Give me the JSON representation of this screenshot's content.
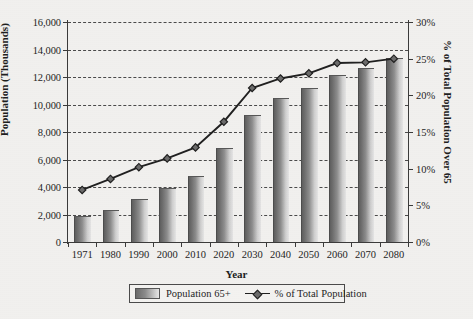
{
  "chart_data": {
    "type": "bar",
    "title": "",
    "xlabel": "Year",
    "ylabel": "Population (Thousands)",
    "y2label": "% of Total Population Over 65",
    "categories": [
      "1971",
      "1980",
      "1990",
      "2000",
      "2010",
      "2020",
      "2030",
      "2040",
      "2050",
      "2060",
      "2070",
      "2080"
    ],
    "ylim": [
      0,
      16000
    ],
    "y2lim": [
      0,
      30
    ],
    "yticks": [
      "0",
      "2,000",
      "4,000",
      "6,000",
      "8,000",
      "10,000",
      "12,000",
      "14,000",
      "16,000"
    ],
    "ytick_values": [
      0,
      2000,
      4000,
      6000,
      8000,
      10000,
      12000,
      14000,
      16000
    ],
    "y2ticks": [
      "0%",
      "5%",
      "10%",
      "15%",
      "20%",
      "25%",
      "30%"
    ],
    "y2tick_values": [
      0,
      5,
      10,
      15,
      20,
      25,
      30
    ],
    "grid": true,
    "legend_position": "bottom",
    "series": [
      {
        "name": "Population 65+",
        "type": "bar",
        "axis": "left",
        "values": [
          1800,
          2250,
          3050,
          3850,
          4750,
          6750,
          9200,
          10400,
          11150,
          12050,
          12550,
          13300
        ]
      },
      {
        "name": "% of Total Population",
        "type": "line",
        "axis": "right",
        "values": [
          7.1,
          8.6,
          10.2,
          11.4,
          12.9,
          16.4,
          21.0,
          22.3,
          23.0,
          24.4,
          24.5,
          25.0
        ]
      }
    ]
  },
  "legend": {
    "items": [
      {
        "label": "Population 65+",
        "marker": "bar-swatch",
        "color": "#8b8b8b"
      },
      {
        "label": "% of Total Population",
        "marker": "line-diamond",
        "color": "#1f1f1f"
      }
    ]
  },
  "colors": {
    "background": "#f2f1ef",
    "axis": "#3a3a3a",
    "grid": "#4a4a4a",
    "bar_dark": "#5e5e5e",
    "bar_light": "#e6e6e6",
    "line": "#1f1f1f",
    "marker_fill": "#6b6b6b"
  }
}
